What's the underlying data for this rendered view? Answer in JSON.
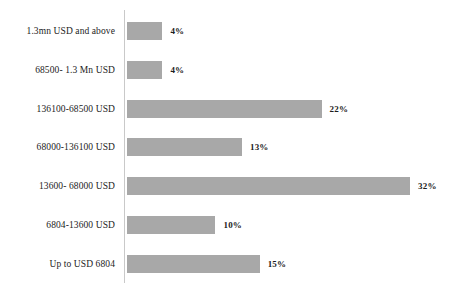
{
  "chart_data": {
    "type": "bar",
    "orientation": "horizontal",
    "title": "",
    "subtitle": "",
    "xlabel": "",
    "ylabel": "",
    "grid": false,
    "legend": null,
    "axis_line": true,
    "xlim": [
      0,
      32
    ],
    "value_suffix": "%",
    "categories": [
      "1.3mn USD and above",
      "68500- 1.3 Mn USD",
      "136100-68500 USD",
      "68000-136100 USD",
      "13600- 68000 USD",
      "6804-13600 USD",
      "Up to USD 6804"
    ],
    "values": [
      4,
      4,
      22,
      13,
      32,
      10,
      15
    ],
    "data_labels": [
      "4%",
      "4%",
      "22%",
      "13%",
      "32%",
      "10%",
      "15%"
    ],
    "colors": {
      "bar_fill": "#a8a8a8",
      "axis_line": "#c9c9c9",
      "text": "#1c1c1c",
      "background": "#ffffff"
    }
  }
}
